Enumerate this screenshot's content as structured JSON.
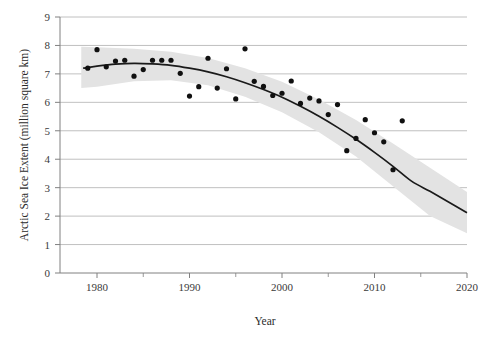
{
  "chart_data": {
    "type": "scatter",
    "title": "",
    "subtitle": "",
    "xlabel": "Year",
    "ylabel": "Arctic Sea Ice Extent (million square km)",
    "xlim": [
      1976,
      2020
    ],
    "ylim": [
      0,
      9
    ],
    "xticks": [
      1980,
      1990,
      2000,
      2010,
      2020
    ],
    "xtick_labels": [
      "1980",
      "1990",
      "2000",
      "2010",
      "2020"
    ],
    "yticks": [
      0,
      1,
      2,
      3,
      4,
      5,
      6,
      7,
      8,
      9
    ],
    "ytick_labels": [
      "0",
      "1",
      "2",
      "3",
      "4",
      "5",
      "6",
      "7",
      "8",
      "9"
    ],
    "grid": "horizontal",
    "legend": "none",
    "series": [
      {
        "name": "Annual Arctic sea ice extent",
        "type": "scatter",
        "marker": "filled-circle",
        "color": "#111111",
        "points": [
          {
            "x": 1979,
            "y": 7.2
          },
          {
            "x": 1980,
            "y": 7.85
          },
          {
            "x": 1981,
            "y": 7.25
          },
          {
            "x": 1982,
            "y": 7.45
          },
          {
            "x": 1983,
            "y": 7.48
          },
          {
            "x": 1984,
            "y": 6.92
          },
          {
            "x": 1985,
            "y": 7.15
          },
          {
            "x": 1986,
            "y": 7.48
          },
          {
            "x": 1987,
            "y": 7.48
          },
          {
            "x": 1988,
            "y": 7.48
          },
          {
            "x": 1989,
            "y": 7.02
          },
          {
            "x": 1990,
            "y": 6.22
          },
          {
            "x": 1991,
            "y": 6.55
          },
          {
            "x": 1992,
            "y": 7.55
          },
          {
            "x": 1993,
            "y": 6.5
          },
          {
            "x": 1994,
            "y": 7.18
          },
          {
            "x": 1995,
            "y": 6.12
          },
          {
            "x": 1996,
            "y": 7.88
          },
          {
            "x": 1997,
            "y": 6.74
          },
          {
            "x": 1998,
            "y": 6.56
          },
          {
            "x": 1999,
            "y": 6.24
          },
          {
            "x": 2000,
            "y": 6.32
          },
          {
            "x": 2001,
            "y": 6.75
          },
          {
            "x": 2002,
            "y": 5.96
          },
          {
            "x": 2003,
            "y": 6.15
          },
          {
            "x": 2004,
            "y": 6.05
          },
          {
            "x": 2005,
            "y": 5.57
          },
          {
            "x": 2006,
            "y": 5.92
          },
          {
            "x": 2007,
            "y": 4.3
          },
          {
            "x": 2008,
            "y": 4.73
          },
          {
            "x": 2009,
            "y": 5.39
          },
          {
            "x": 2010,
            "y": 4.93
          },
          {
            "x": 2011,
            "y": 4.61
          },
          {
            "x": 2012,
            "y": 3.63
          },
          {
            "x": 2013,
            "y": 5.35
          }
        ]
      },
      {
        "name": "Fitted quadratic trend",
        "type": "line",
        "color": "#1a1a1a",
        "points": [
          {
            "x": 1978.5,
            "y": 7.2
          },
          {
            "x": 1980,
            "y": 7.27
          },
          {
            "x": 1982,
            "y": 7.34
          },
          {
            "x": 1984,
            "y": 7.37
          },
          {
            "x": 1986,
            "y": 7.35
          },
          {
            "x": 1988,
            "y": 7.3
          },
          {
            "x": 1990,
            "y": 7.2
          },
          {
            "x": 1992,
            "y": 7.07
          },
          {
            "x": 1994,
            "y": 6.9
          },
          {
            "x": 1996,
            "y": 6.69
          },
          {
            "x": 1998,
            "y": 6.45
          },
          {
            "x": 2000,
            "y": 6.18
          },
          {
            "x": 2002,
            "y": 5.86
          },
          {
            "x": 2004,
            "y": 5.51
          },
          {
            "x": 2006,
            "y": 5.12
          },
          {
            "x": 2008,
            "y": 4.7
          },
          {
            "x": 2010,
            "y": 4.24
          },
          {
            "x": 2012,
            "y": 3.75
          },
          {
            "x": 2014,
            "y": 3.23
          },
          {
            "x": 2016,
            "y": 2.87
          },
          {
            "x": 2018,
            "y": 2.5
          },
          {
            "x": 2020,
            "y": 2.12
          }
        ]
      },
      {
        "name": "Confidence band",
        "type": "band",
        "color": "#e2e2e2",
        "upper": [
          {
            "x": 1978.3,
            "y": 7.95
          },
          {
            "x": 1980,
            "y": 7.94
          },
          {
            "x": 1984,
            "y": 7.88
          },
          {
            "x": 1988,
            "y": 7.78
          },
          {
            "x": 1992,
            "y": 7.56
          },
          {
            "x": 1996,
            "y": 7.2
          },
          {
            "x": 2000,
            "y": 6.72
          },
          {
            "x": 2004,
            "y": 6.1
          },
          {
            "x": 2008,
            "y": 5.38
          },
          {
            "x": 2012,
            "y": 4.55
          },
          {
            "x": 2016,
            "y": 3.7
          },
          {
            "x": 2020,
            "y": 2.85
          }
        ],
        "lower": [
          {
            "x": 1978.3,
            "y": 6.5
          },
          {
            "x": 1980,
            "y": 6.55
          },
          {
            "x": 1984,
            "y": 6.74
          },
          {
            "x": 1988,
            "y": 6.78
          },
          {
            "x": 1992,
            "y": 6.6
          },
          {
            "x": 1996,
            "y": 6.2
          },
          {
            "x": 2000,
            "y": 5.65
          },
          {
            "x": 2004,
            "y": 4.95
          },
          {
            "x": 2008,
            "y": 4.1
          },
          {
            "x": 2012,
            "y": 3.05
          },
          {
            "x": 2016,
            "y": 2.0
          },
          {
            "x": 2020,
            "y": 1.4
          }
        ]
      }
    ]
  },
  "style": {
    "grid_color": "#b0b0b0",
    "axis_color": "#808080",
    "band_color": "#e3e3e3",
    "marker_color": "#101010",
    "trend_color": "#1a1a1a",
    "background": "#ffffff"
  }
}
